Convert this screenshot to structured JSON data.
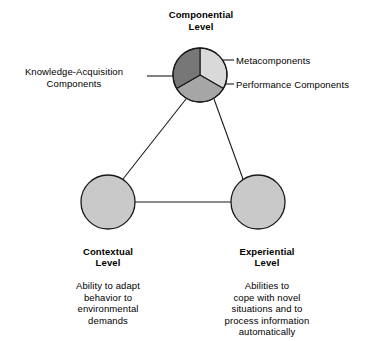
{
  "diagram": {
    "title_top": "Componential\nLevel",
    "nodes": {
      "componential": {
        "label": "Componential\nLevel",
        "segments": [
          {
            "name": "Metacomponents",
            "label": "Metacomponents",
            "color": "#d9d9d9"
          },
          {
            "name": "Performance Components",
            "label": "Performance Components",
            "color": "#a6a6a6"
          },
          {
            "name": "Knowledge-Acquisition Components",
            "label": "Knowledge-Acquisition\nComponents",
            "color": "#777777"
          }
        ]
      },
      "contextual": {
        "title": "Contextual\nLevel",
        "description": "Ability to adapt\nbehavior to\nenvironmental\ndemands",
        "color": "#c9c9c9"
      },
      "experiential": {
        "title": "Experiential\nLevel",
        "description": "Abilities to\ncope with novel\nsituations and to\nprocess information\nautomatically",
        "color": "#c9c9c9"
      }
    },
    "colors": {
      "stroke": "#1a1a1a",
      "background": "#ffffff",
      "segment_light": "#d9d9d9",
      "segment_medium": "#a6a6a6",
      "segment_dark": "#777777",
      "circle_fill": "#c9c9c9"
    }
  }
}
